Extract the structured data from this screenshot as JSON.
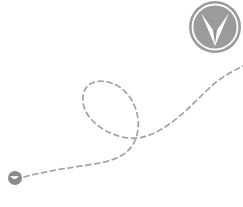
{
  "illustration": {
    "description": "Dashed route with a loop from a start point to a logo badge",
    "path_color": "#a8a8a8",
    "start_marker": {
      "icon": "start-point-icon",
      "color": "#8a8a8a"
    },
    "logo": {
      "icon": "arrow-v-logo-icon",
      "color": "#9a9a9a",
      "ring_color": "#ffffff"
    }
  }
}
